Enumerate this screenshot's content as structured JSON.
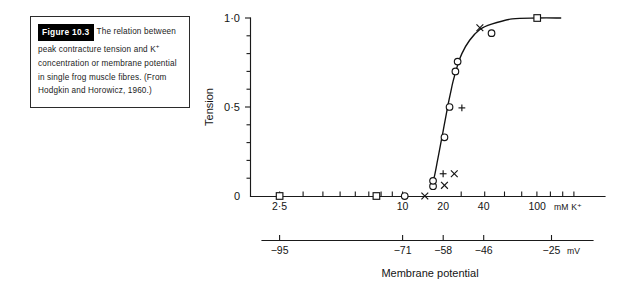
{
  "caption": {
    "figure_tag": "Figure 10.3",
    "lines": [
      "The relation",
      "between peak contracture",
      "tension and K⁺ concentration or",
      "membrane potential in single frog",
      "muscle fibres. (From Hodgkin and",
      "Horowicz, 1960.)"
    ],
    "full_text": "Figure 10.3 The relation between peak contracture tension and K⁺ concentration or membrane potential in single frog muscle fibres. (From Hodgkin and Horowicz, 1960.)"
  },
  "chart_data": {
    "type": "scatter",
    "title": "",
    "xlabel": "Membrane potential",
    "ylabel": "Tension",
    "x_unit_label": "mM K⁺",
    "mv_unit_label": "mV",
    "x_scale": "log",
    "xlim": [
      1.8,
      150
    ],
    "ylim": [
      0,
      1.0
    ],
    "grid": false,
    "legend": "none",
    "x_ticks_labeled": [
      "2·5",
      "10",
      "20",
      "40",
      "100"
    ],
    "x_tick_values": [
      2.5,
      10,
      20,
      40,
      100
    ],
    "y_ticks_labeled": [
      "0",
      "0·5",
      "1·0"
    ],
    "y_tick_values": [
      0,
      0.5,
      1.0
    ],
    "y_minor_step": 0.1,
    "mv_axis": {
      "ticks_labeled": [
        "−95",
        "−71",
        "−58",
        "−46",
        "−25"
      ],
      "tick_k_values": [
        2.5,
        10,
        20,
        40,
        100
      ]
    },
    "series": [
      {
        "name": "circles",
        "marker": "circle",
        "points": [
          {
            "x": 15.0,
            "y": 0.0
          },
          {
            "x": 22.5,
            "y": 0.055
          },
          {
            "x": 22.5,
            "y": 0.085
          },
          {
            "x": 26.5,
            "y": 0.33
          },
          {
            "x": 28.5,
            "y": 0.5
          },
          {
            "x": 31.0,
            "y": 0.7
          },
          {
            "x": 32.0,
            "y": 0.755
          },
          {
            "x": 52.0,
            "y": 0.915
          }
        ]
      },
      {
        "name": "squares",
        "marker": "square",
        "points": [
          {
            "x": 2.5,
            "y": 0.0
          },
          {
            "x": 10.0,
            "y": 0.0
          },
          {
            "x": 100.0,
            "y": 1.0
          }
        ]
      },
      {
        "name": "plus",
        "marker": "plus",
        "points": [
          {
            "x": 26.0,
            "y": 0.125
          },
          {
            "x": 34.0,
            "y": 0.495
          }
        ]
      },
      {
        "name": "crosses",
        "marker": "cross",
        "points": [
          {
            "x": 20.0,
            "y": 0.0
          },
          {
            "x": 26.5,
            "y": 0.06
          },
          {
            "x": 30.5,
            "y": 0.125
          },
          {
            "x": 44.0,
            "y": 0.945
          }
        ]
      }
    ],
    "fitted_curve": {
      "description": "sigmoid through circle data",
      "points": [
        {
          "x": 22.0,
          "y": 0.055
        },
        {
          "x": 23.0,
          "y": 0.115
        },
        {
          "x": 24.0,
          "y": 0.2
        },
        {
          "x": 25.0,
          "y": 0.285
        },
        {
          "x": 26.0,
          "y": 0.365
        },
        {
          "x": 27.0,
          "y": 0.445
        },
        {
          "x": 28.0,
          "y": 0.52
        },
        {
          "x": 29.0,
          "y": 0.585
        },
        {
          "x": 30.0,
          "y": 0.645
        },
        {
          "x": 32.0,
          "y": 0.735
        },
        {
          "x": 34.0,
          "y": 0.8
        },
        {
          "x": 38.0,
          "y": 0.875
        },
        {
          "x": 44.0,
          "y": 0.935
        },
        {
          "x": 52.0,
          "y": 0.965
        },
        {
          "x": 70.0,
          "y": 0.995
        },
        {
          "x": 100.0,
          "y": 1.0
        },
        {
          "x": 140.0,
          "y": 1.0
        }
      ]
    }
  }
}
